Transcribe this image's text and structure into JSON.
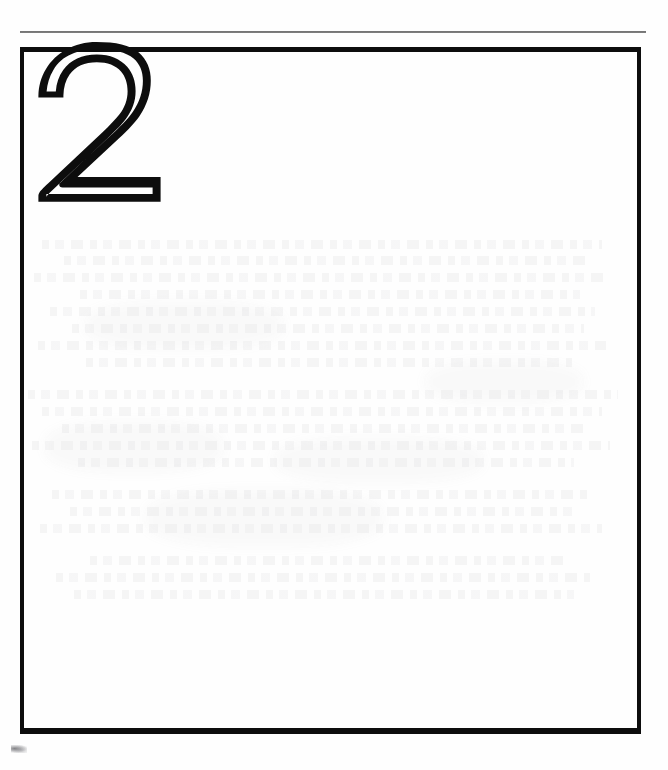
{
  "document": {
    "type": "scanned-book-page",
    "page_width": 668,
    "page_height": 770,
    "background_color": "#fefefe",
    "ink_color": "#0d0d0d",
    "rule_color": "#5d5d5d"
  },
  "header_rule": {
    "name": "horizontal-rule",
    "x": 20,
    "y": 31,
    "width": 626,
    "thickness": 2
  },
  "frame": {
    "name": "page-border-box",
    "x": 20,
    "y": 47,
    "width": 621,
    "height": 687,
    "stroke_width": 5
  },
  "chapter": {
    "number": "2",
    "style": "outlined",
    "x": 38,
    "y": 48,
    "width": 127,
    "height": 155
  },
  "artifacts": {
    "smudge_label": "scan smudge",
    "bleedthrough_label": "bleed-through ghosting"
  },
  "ghost_bands": [
    {
      "top": 0,
      "width": 560,
      "left": 18
    },
    {
      "top": 16,
      "width": 528,
      "left": 40
    },
    {
      "top": 33,
      "width": 572,
      "left": 10
    },
    {
      "top": 50,
      "width": 500,
      "left": 56
    },
    {
      "top": 67,
      "width": 545,
      "left": 26
    },
    {
      "top": 84,
      "width": 512,
      "left": 48
    },
    {
      "top": 101,
      "width": 568,
      "left": 14
    },
    {
      "top": 118,
      "width": 486,
      "left": 62
    },
    {
      "top": 150,
      "width": 590,
      "left": 4
    },
    {
      "top": 167,
      "width": 560,
      "left": 18
    },
    {
      "top": 184,
      "width": 524,
      "left": 38
    },
    {
      "top": 201,
      "width": 578,
      "left": 8
    },
    {
      "top": 218,
      "width": 496,
      "left": 54
    },
    {
      "top": 250,
      "width": 540,
      "left": 28
    },
    {
      "top": 267,
      "width": 508,
      "left": 46
    },
    {
      "top": 284,
      "width": 562,
      "left": 16
    },
    {
      "top": 316,
      "width": 480,
      "left": 66
    },
    {
      "top": 333,
      "width": 534,
      "left": 32
    },
    {
      "top": 350,
      "width": 500,
      "left": 50
    }
  ],
  "ghost_blotches": [
    {
      "left": 20,
      "top": 180,
      "width": 180,
      "height": 54
    },
    {
      "left": 250,
      "top": 196,
      "width": 210,
      "height": 48
    },
    {
      "left": 120,
      "top": 248,
      "width": 240,
      "height": 60
    },
    {
      "left": 400,
      "top": 120,
      "width": 160,
      "height": 44
    },
    {
      "left": 60,
      "top": 60,
      "width": 200,
      "height": 50
    }
  ]
}
